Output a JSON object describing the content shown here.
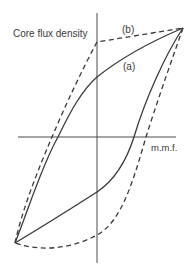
{
  "diagram": {
    "axes": {
      "y_label": "Core flux density",
      "x_label": "m.m.f."
    },
    "curves": [
      {
        "id": "a",
        "label": "(a)",
        "style": "solid",
        "description": "Normal hysteresis loop"
      },
      {
        "id": "b",
        "label": "(b)",
        "style": "dashed",
        "description": "Square (rectangular) hysteresis loop"
      }
    ],
    "colors": {
      "line": "#3a3a3a",
      "axis": "#4a4a4a",
      "background": "#ffffff"
    }
  }
}
